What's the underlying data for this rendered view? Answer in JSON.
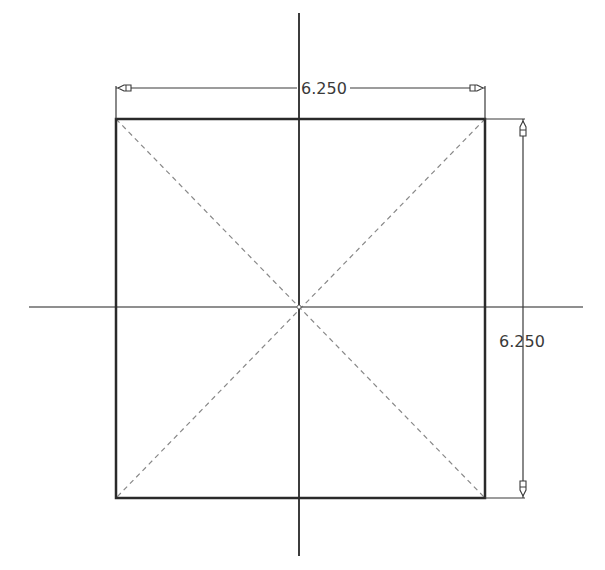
{
  "drawing": {
    "type": "sketch",
    "shape": "square",
    "colors": {
      "background": "#ffffff",
      "outline": "#2a2a2a",
      "axis": "#3c3c3c",
      "construction": "#888888",
      "dimension": "#3a3a3a"
    },
    "square": {
      "left": 116,
      "top": 119,
      "right": 485,
      "bottom": 498
    },
    "center": {
      "x": 299,
      "y": 307
    },
    "axes": {
      "vertical": {
        "x": 299,
        "y1": 13,
        "y2": 556
      },
      "horizontal": {
        "y": 307,
        "x1": 29,
        "x2": 583
      }
    },
    "dimensions": {
      "horizontal": {
        "label": "6.250",
        "line_y": 88,
        "x1": 116,
        "x2": 485,
        "text_x": 301,
        "text_y": 94
      },
      "vertical": {
        "label": "6.250",
        "line_x": 523,
        "y1": 119,
        "y2": 498,
        "text_x": 499,
        "text_y": 347
      }
    }
  }
}
